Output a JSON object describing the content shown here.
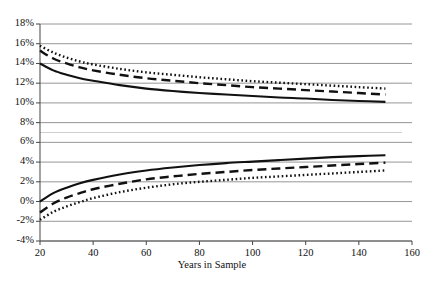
{
  "chart_data": {
    "type": "line",
    "title": "",
    "xlabel": "Years in Sample",
    "ylabel": "",
    "xlim": [
      20,
      160
    ],
    "ylim": [
      -4,
      18
    ],
    "xticks": [
      20,
      40,
      60,
      80,
      100,
      120,
      140,
      160
    ],
    "xtick_labels": [
      "20",
      "40",
      "60",
      "80",
      "100",
      "120",
      "140",
      "160"
    ],
    "yticks": [
      -4,
      -2,
      0,
      2,
      4,
      6,
      8,
      10,
      12,
      14,
      16,
      18
    ],
    "ytick_labels": [
      "-4%",
      "-2%",
      "0%",
      "2%",
      "4%",
      "6%",
      "8%",
      "10%",
      "12%",
      "14%",
      "16%",
      "18%"
    ],
    "grid": "horizontal",
    "legend": "none",
    "data_x_range": [
      20,
      150
    ],
    "series": [
      {
        "name": "upper-solid",
        "style": "solid",
        "color": "#111111",
        "x": [
          20,
          25,
          30,
          35,
          40,
          50,
          60,
          70,
          80,
          90,
          100,
          110,
          120,
          130,
          140,
          150
        ],
        "values": [
          14.0,
          13.3,
          12.85,
          12.5,
          12.25,
          11.8,
          11.45,
          11.2,
          11.0,
          10.85,
          10.7,
          10.55,
          10.45,
          10.3,
          10.2,
          10.1
        ]
      },
      {
        "name": "upper-dashed",
        "style": "dashed",
        "color": "#111111",
        "x": [
          20,
          25,
          30,
          35,
          40,
          50,
          60,
          70,
          80,
          90,
          100,
          110,
          120,
          130,
          140,
          150
        ],
        "values": [
          15.3,
          14.5,
          14.0,
          13.6,
          13.3,
          12.85,
          12.5,
          12.25,
          12.0,
          11.8,
          11.6,
          11.45,
          11.3,
          11.15,
          11.0,
          10.85
        ]
      },
      {
        "name": "upper-dotted",
        "style": "dotted",
        "color": "#111111",
        "x": [
          20,
          25,
          30,
          35,
          40,
          50,
          60,
          70,
          80,
          90,
          100,
          110,
          120,
          130,
          140,
          150
        ],
        "values": [
          15.8,
          15.1,
          14.6,
          14.2,
          13.9,
          13.45,
          13.1,
          12.85,
          12.6,
          12.4,
          12.2,
          12.05,
          11.9,
          11.75,
          11.6,
          11.45
        ]
      },
      {
        "name": "lower-solid",
        "style": "solid",
        "color": "#111111",
        "x": [
          20,
          25,
          30,
          35,
          40,
          50,
          60,
          70,
          80,
          90,
          100,
          110,
          120,
          130,
          140,
          150
        ],
        "values": [
          0.0,
          0.85,
          1.4,
          1.85,
          2.2,
          2.75,
          3.15,
          3.45,
          3.7,
          3.9,
          4.05,
          4.2,
          4.35,
          4.5,
          4.6,
          4.7
        ]
      },
      {
        "name": "lower-dashed",
        "style": "dashed",
        "color": "#111111",
        "x": [
          20,
          25,
          30,
          35,
          40,
          50,
          60,
          70,
          80,
          90,
          100,
          110,
          120,
          130,
          140,
          150
        ],
        "values": [
          -1.1,
          -0.2,
          0.4,
          0.85,
          1.25,
          1.8,
          2.25,
          2.55,
          2.8,
          3.0,
          3.2,
          3.35,
          3.5,
          3.65,
          3.8,
          3.95
        ]
      },
      {
        "name": "lower-dotted",
        "style": "dotted",
        "color": "#111111",
        "x": [
          20,
          25,
          30,
          35,
          40,
          50,
          60,
          70,
          80,
          90,
          100,
          110,
          120,
          130,
          140,
          150
        ],
        "values": [
          -1.85,
          -1.05,
          -0.5,
          -0.05,
          0.35,
          0.95,
          1.4,
          1.75,
          2.0,
          2.2,
          2.4,
          2.55,
          2.7,
          2.85,
          3.0,
          3.15
        ]
      }
    ]
  }
}
